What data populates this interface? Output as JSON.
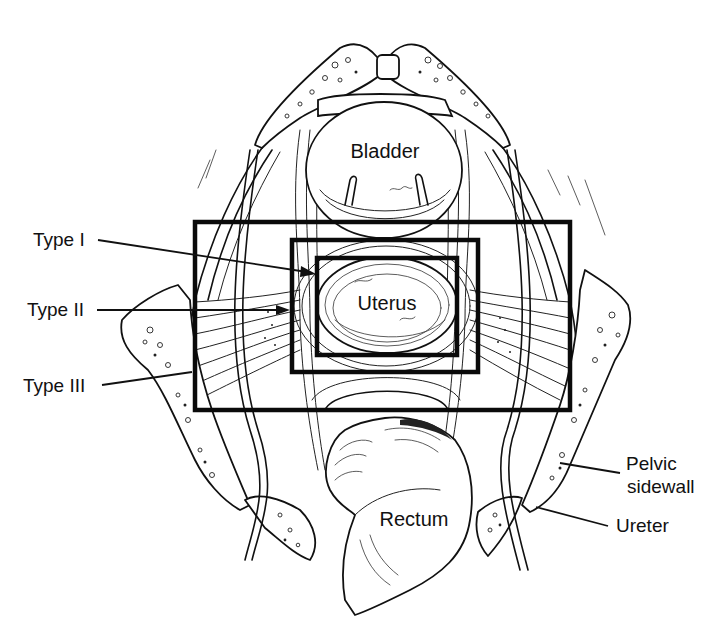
{
  "figure": {
    "type": "anatomical line drawing",
    "view": "superior view of female pelvis showing radical hysterectomy resection types",
    "colors": {
      "line": "#111111",
      "background": "#ffffff"
    }
  },
  "organs": {
    "bladder": "Bladder",
    "uterus": "Uterus",
    "rectum": "Rectum"
  },
  "labels": {
    "type_1": "Type I",
    "type_2": "Type II",
    "type_3": "Type III",
    "pelvic_sidewall_line1": "Pelvic",
    "pelvic_sidewall_line2": "sidewall",
    "ureter": "Ureter"
  },
  "resection_boxes": [
    {
      "name": "Type I",
      "x": 317,
      "y": 258,
      "width": 140,
      "height": 97
    },
    {
      "name": "Type II",
      "x": 292,
      "y": 240,
      "width": 186,
      "height": 132
    },
    {
      "name": "Type III",
      "x": 195,
      "y": 222,
      "width": 375,
      "height": 188
    }
  ]
}
